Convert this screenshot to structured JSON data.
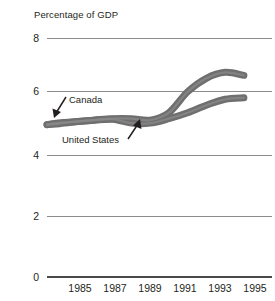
{
  "chart_data": {
    "type": "line",
    "title": "Percentage of GDP",
    "xlabel": "",
    "ylabel": "",
    "ylim": [
      0,
      8
    ],
    "xlim": [
      1983.5,
      1995.5
    ],
    "grid": true,
    "legend_position": "inline-annotation",
    "y_ticks": [
      "8",
      "6",
      "4",
      "2",
      "0"
    ],
    "y_tick_values": [
      8,
      6,
      4,
      2,
      0
    ],
    "x_ticks": [
      "1985",
      "1987",
      "1989",
      "1991",
      "1993",
      "1995"
    ],
    "x_tick_values": [
      1985,
      1987,
      1989,
      1991,
      1993,
      1995
    ],
    "x": [
      1983.5,
      1984,
      1985,
      1986,
      1987,
      1988,
      1989,
      1990,
      1991,
      1992,
      1993,
      1994
    ],
    "series": [
      {
        "name": "Canada",
        "color": "#6f6f6f",
        "values": [
          5.1,
          5.15,
          5.2,
          5.25,
          5.3,
          5.3,
          5.25,
          5.5,
          6.2,
          6.65,
          6.85,
          6.75
        ]
      },
      {
        "name": "United States",
        "color": "#6f6f6f",
        "values": [
          5.1,
          5.12,
          5.2,
          5.25,
          5.28,
          5.15,
          5.15,
          5.3,
          5.5,
          5.75,
          5.95,
          6.0
        ]
      }
    ],
    "annotations": [
      {
        "label": "Canada",
        "points_to_series": "Canada",
        "arrow_direction": "down-left"
      },
      {
        "label": "United States",
        "points_to_series": "United States",
        "arrow_direction": "up-right"
      }
    ],
    "colors": {
      "series": "#6f6f6f",
      "gridline": "#8c8c8c",
      "axis": "#4a4a4a",
      "text": "#231f20",
      "background": "#ffffff"
    }
  }
}
